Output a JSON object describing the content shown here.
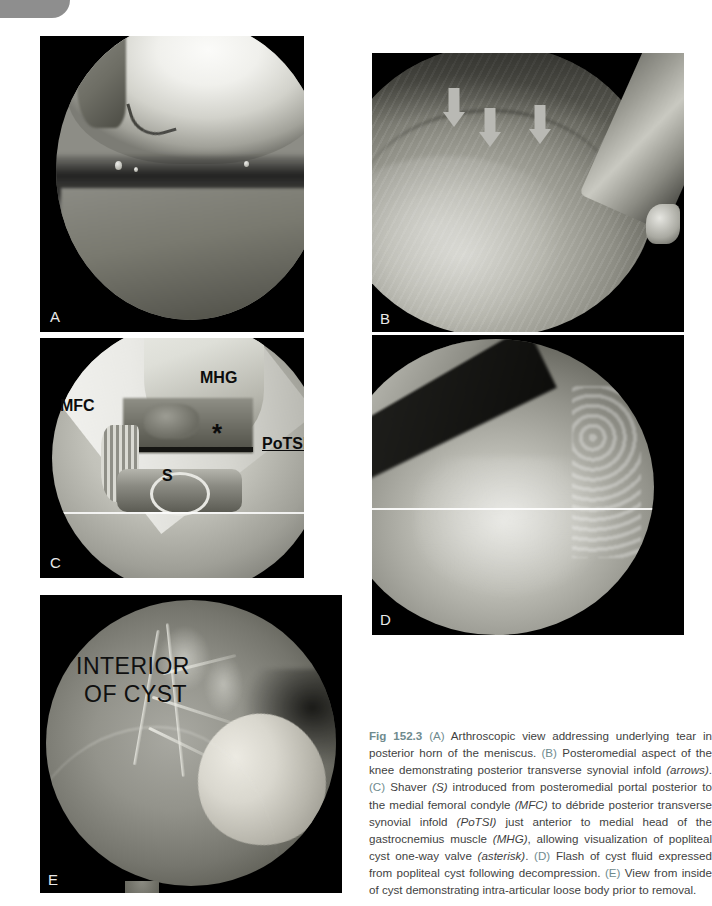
{
  "figure": {
    "number": "Fig 152.3",
    "panel_letters": [
      "A",
      "B",
      "C",
      "D",
      "E"
    ],
    "accent_color": "#6f8b8e",
    "caption_color": "#3f3f3f",
    "caption_segments": [
      {
        "type": "figno",
        "text": "Fig 152.3"
      },
      {
        "type": "plain",
        "text": " "
      },
      {
        "type": "panel",
        "text": "(A)"
      },
      {
        "type": "plain",
        "text": " Arthroscopic view addressing underlying tear in posterior horn of the meniscus. "
      },
      {
        "type": "panel",
        "text": "(B)"
      },
      {
        "type": "plain",
        "text": " Posteromedial aspect of the knee demonstrating posterior transverse synovial infold "
      },
      {
        "type": "italic",
        "text": "(arrows)"
      },
      {
        "type": "plain",
        "text": ". "
      },
      {
        "type": "panel",
        "text": "(C)"
      },
      {
        "type": "plain",
        "text": " Shaver "
      },
      {
        "type": "italic",
        "text": "(S)"
      },
      {
        "type": "plain",
        "text": " introduced from posteromedial portal posterior to the medial femoral condyle "
      },
      {
        "type": "italic",
        "text": "(MFC)"
      },
      {
        "type": "plain",
        "text": " to débride posterior transverse synovial infold "
      },
      {
        "type": "italic",
        "text": "(PoTSI)"
      },
      {
        "type": "plain",
        "text": " just anterior to medial head of the gastrocnemius muscle "
      },
      {
        "type": "italic",
        "text": "(MHG)"
      },
      {
        "type": "plain",
        "text": ", allowing visualization of popliteal cyst one-way valve "
      },
      {
        "type": "italic",
        "text": "(asterisk)"
      },
      {
        "type": "plain",
        "text": ". "
      },
      {
        "type": "panel",
        "text": "(D)"
      },
      {
        "type": "plain",
        "text": " Flash of cyst fluid expressed from popliteal cyst following decompression. "
      },
      {
        "type": "panel",
        "text": "(E)"
      },
      {
        "type": "plain",
        "text": " View from inside of cyst demonstrating intra-articular loose body prior to removal."
      }
    ],
    "caption_plain_text": "Fig 152.3 (A) Arthroscopic view addressing underlying tear in posterior horn of the meniscus. (B) Posteromedial aspect of the knee demonstrating posterior transverse synovial infold (arrows). (C) Shaver (S) introduced from posteromedial portal posterior to the medial femoral condyle (MFC) to débride posterior transverse synovial infold (PoTSI) just anterior to medial head of the gastrocnemius muscle (MHG), allowing visualization of popliteal cyst one-way valve (asterisk). (D) Flash of cyst fluid expressed from popliteal cyst following decompression. (E) View from inside of cyst demonstrating intra-articular loose body prior to removal."
  },
  "panels": {
    "a": {
      "letter": "A",
      "description": "Arthroscopic view of posterior horn meniscal tear"
    },
    "b": {
      "letter": "B",
      "description": "Posteromedial aspect of knee with posterior transverse synovial infold",
      "arrow_count": 3,
      "arrow_color": "#b9b9b4"
    },
    "c": {
      "letter": "C",
      "description": "Shaver introduced from posteromedial portal",
      "annotations": [
        {
          "name": "mfc",
          "text": "MFC",
          "underline": false
        },
        {
          "name": "mhg",
          "text": "MHG",
          "underline": false
        },
        {
          "name": "asterisk",
          "text": "*",
          "underline": false
        },
        {
          "name": "potsi",
          "text": "PoTSI",
          "underline": true
        },
        {
          "name": "shaver",
          "text": "S",
          "underline": false
        }
      ]
    },
    "d": {
      "letter": "D",
      "description": "Flash of cyst fluid expressed from popliteal cyst"
    },
    "e": {
      "letter": "E",
      "description": "View from inside of cyst with intra-articular loose body",
      "label_line1": "INTERIOR",
      "label_line2": "OF CYST"
    }
  }
}
